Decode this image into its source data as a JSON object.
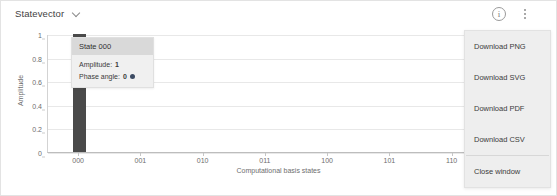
{
  "header": {
    "title": "Statevector",
    "dropdown_icon": "chevron-down-icon",
    "info_icon": "info-icon",
    "info_glyph": "i",
    "menu_icon": "kebab-menu-icon"
  },
  "menu": {
    "items": [
      {
        "label": "Download PNG"
      },
      {
        "label": "Download SVG"
      },
      {
        "label": "Download PDF"
      },
      {
        "label": "Download CSV"
      },
      {
        "label": "Close window"
      }
    ]
  },
  "tooltip": {
    "state_title": "State 000",
    "amplitude_label": "Amplitude:",
    "amplitude_value": "1",
    "phase_label": "Phase angle:",
    "phase_value": "0",
    "phase_color": "#3c4b63"
  },
  "chart_data": {
    "type": "bar",
    "title": "",
    "categories": [
      "000",
      "001",
      "010",
      "011",
      "100",
      "101",
      "110",
      "111"
    ],
    "values": [
      1,
      0,
      0,
      0,
      0,
      0,
      0,
      0
    ],
    "xlabel": "Computational basis states",
    "ylabel": "Amplitude",
    "ylim": [
      0,
      1
    ],
    "yticks": [
      0,
      0.2,
      0.4,
      0.6,
      0.8,
      1
    ],
    "ytick_labels": [
      "0",
      "0.2",
      "0.4",
      "0.6",
      "0.8",
      "1"
    ],
    "grid": true,
    "legend": false,
    "bar_color": "#4a4a4a"
  }
}
